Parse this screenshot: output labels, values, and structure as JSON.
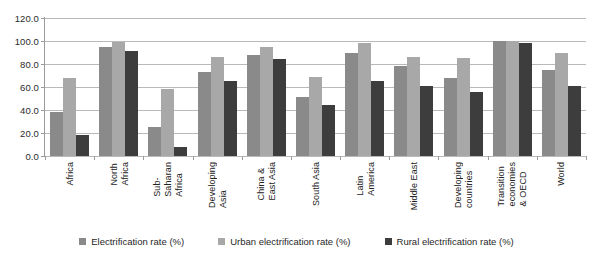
{
  "chart_data": {
    "type": "bar",
    "title": "",
    "subtitle": "",
    "xlabel": "",
    "ylabel": "",
    "ylim": [
      0,
      120
    ],
    "ytick_step": 20,
    "ytick_labels": [
      "0.0",
      "20.0",
      "40.0",
      "60.0",
      "80.0",
      "100.0",
      "120.0"
    ],
    "grid": true,
    "legend_position": "bottom",
    "categories": [
      "Africa",
      "North Africa",
      "Sub-Saharan Africa",
      "Developing Asia",
      "China & East Asia",
      "South Asia",
      "Latin America",
      "Middle East",
      "Developing countries",
      "Transition economies & OECD",
      "World"
    ],
    "category_lines": [
      [
        "Africa"
      ],
      [
        "North",
        "Africa"
      ],
      [
        "Sub-",
        "Saharan",
        "Africa"
      ],
      [
        "Developing",
        "Asia"
      ],
      [
        "China &",
        "East Asia"
      ],
      [
        "South Asia"
      ],
      [
        "Latin",
        "America"
      ],
      [
        "Middle East"
      ],
      [
        "Developing",
        "countries"
      ],
      [
        "Transition",
        "economies",
        "& OECD"
      ],
      [
        "World"
      ]
    ],
    "series": [
      {
        "name": "Electrification rate (%)",
        "color": "#8a8a8a",
        "values": [
          38.0,
          95.0,
          25.0,
          73.0,
          88.0,
          51.0,
          90.0,
          78.0,
          68.0,
          100.0,
          75.0
        ]
      },
      {
        "name": "Urban electrification rate (%)",
        "color": "#a8a8a8",
        "values": [
          68.0,
          99.0,
          58.0,
          86.0,
          95.0,
          69.0,
          98.0,
          86.0,
          85.0,
          100.0,
          90.0
        ]
      },
      {
        "name": "Rural electrification rate (%)",
        "color": "#3d3d3d",
        "values": [
          18.0,
          91.0,
          8.0,
          65.0,
          84.0,
          44.0,
          65.0,
          61.0,
          56.0,
          98.0,
          61.0
        ]
      }
    ]
  },
  "legend": {
    "items": [
      {
        "label": "Electrification rate (%)",
        "color": "#8a8a8a"
      },
      {
        "label": "Urban electrification rate (%)",
        "color": "#a8a8a8"
      },
      {
        "label": "Rural electrification rate (%)",
        "color": "#3d3d3d"
      }
    ]
  }
}
